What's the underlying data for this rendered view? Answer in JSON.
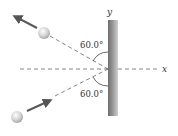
{
  "figure": {
    "axes": {
      "y_label": "y",
      "x_label": "x"
    },
    "angles": [
      {
        "position": "upper",
        "label": "60.0°"
      },
      {
        "position": "lower",
        "label": "60.0°"
      }
    ],
    "colors": {
      "wall_dark": "#6e6e6e",
      "wall_light": "#c8c8c8",
      "dash": "#666666",
      "arrow": "#5a5a5a",
      "ball": "#d8d8d8"
    }
  }
}
